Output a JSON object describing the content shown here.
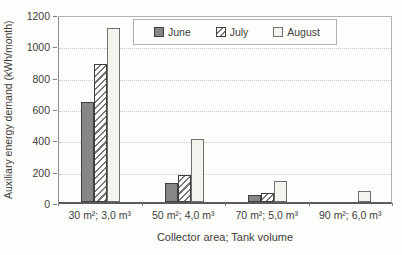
{
  "chart_data": {
    "type": "bar",
    "title": "",
    "categories": [
      "30 m²; 3,0 m³",
      "50 m²; 4,0 m³",
      "70 m²; 5,0 m³",
      "90 m²; 6,0 m³"
    ],
    "series": [
      {
        "name": "June",
        "values": [
          640,
          120,
          45,
          0
        ],
        "pattern": "solid",
        "fill": "#868686",
        "border": "#3f3f3f"
      },
      {
        "name": "July",
        "values": [
          880,
          175,
          60,
          0
        ],
        "pattern": "diagonal-hatch",
        "fill": "#ffffff",
        "hatch": "#787878",
        "border": "#3f3f3f"
      },
      {
        "name": "August",
        "values": [
          1110,
          400,
          135,
          70
        ],
        "pattern": "solid",
        "fill": "#f4f3ee",
        "border": "#6f6f6f"
      }
    ],
    "xlabel": "Collector area; Tank volume",
    "ylabel": "Auxiliary energy demand (kWh/month)",
    "ylim": [
      0,
      1200
    ],
    "yticks": [
      0,
      200,
      400,
      600,
      800,
      1000,
      1200
    ],
    "grid": "horizontal-dotted",
    "legend_position": "top-inside"
  },
  "colors": {
    "grid": "#c9c9c9",
    "frame": "#b2b2b2",
    "axis": "#5a5a5a",
    "text": "#3d3d3d",
    "background": "#fdfdfb"
  }
}
